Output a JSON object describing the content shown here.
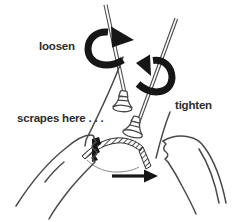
{
  "diagram": {
    "labels": {
      "loosen": "loosen",
      "tighten": "tighten",
      "scrapes_here": "scrapes here . . ."
    },
    "icons": {
      "loosen_rotation_arrow": "rotate-right-ribbon-arrow",
      "tighten_rotation_arrow": "rotate-left-ribbon-arrow",
      "direction_arrow": "right-arrow"
    },
    "colors": {
      "background": "#ffffff",
      "ink": "#4a4a4a",
      "solid_black": "#161616",
      "label_text": "#2d2d2d"
    }
  }
}
